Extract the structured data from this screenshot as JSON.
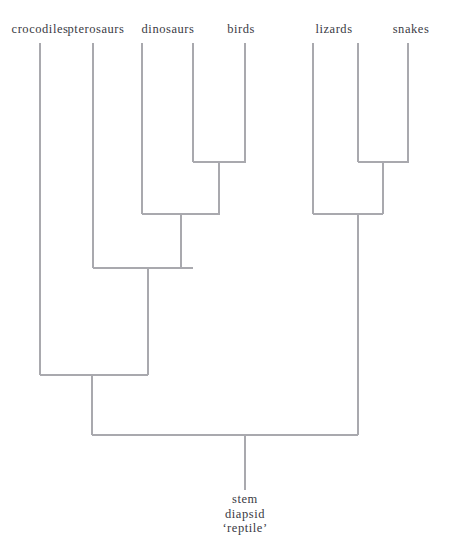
{
  "figure": {
    "type": "cladogram",
    "background_color": "#ffffff",
    "line_color": "#a9a9ae",
    "text_color": "#3a3a44",
    "width": 449,
    "height": 541
  },
  "tips": [
    {
      "label": "crocodiles",
      "x": 40,
      "label_x": 40,
      "label_y": 22
    },
    {
      "label": "pterosaurs",
      "x": 93,
      "label_x": 96,
      "label_y": 22
    },
    {
      "label": "dinosaurs",
      "x": 142,
      "label_x": 168,
      "label_y": 22
    },
    {
      "label": "birds",
      "x": 245,
      "label_x": 241,
      "label_y": 22
    },
    {
      "label": "lizards",
      "x": 313,
      "label_x": 334,
      "label_y": 22
    },
    {
      "label": "snakes",
      "x": 408,
      "label_x": 411,
      "label_y": 22
    }
  ],
  "extra_tip_lines": [
    {
      "x": 193
    },
    {
      "x": 358
    }
  ],
  "root": {
    "lines": [
      "stem",
      "diapsid",
      "‘reptile’"
    ],
    "label_x": 245,
    "label_y": 492,
    "stem_x": 245,
    "stem_top": 435,
    "stem_bottom": 490
  },
  "nodes": [
    {
      "name": "birds-node",
      "bar_y": 162,
      "x_left": 193,
      "x_right": 246,
      "stem_x": 219,
      "stem_to": 214
    },
    {
      "name": "lizards-snakes-node",
      "bar_y": 162,
      "x_left": 358,
      "x_right": 409,
      "stem_x": 383,
      "stem_to": 214
    },
    {
      "name": "dinosaur-bird-node",
      "bar_y": 214,
      "x_left": 142,
      "x_right": 220,
      "stem_x": 181,
      "stem_to": 268
    },
    {
      "name": "squamate-node",
      "bar_y": 214,
      "x_left": 313,
      "x_right": 383,
      "stem_x": 358,
      "stem_to": 435
    },
    {
      "name": "ornithodira-node",
      "bar_y": 268,
      "x_left": 93,
      "x_right": 193,
      "stem_x": 148,
      "stem_to": 375
    },
    {
      "name": "archosaur-node",
      "bar_y": 375,
      "x_left": 40,
      "x_right": 148,
      "stem_x": 92,
      "stem_to": 435
    },
    {
      "name": "root-node",
      "bar_y": 435,
      "x_left": 92,
      "x_right": 358,
      "stem_x": 245,
      "stem_to": 490
    }
  ],
  "tip_stems": [
    {
      "name": "crocodiles-stem",
      "x": 40,
      "y_top": 43,
      "y_bottom": 375
    },
    {
      "name": "pterosaurs-stem",
      "x": 93,
      "y_top": 43,
      "y_bottom": 268
    },
    {
      "name": "dinosaurs-stem",
      "x": 142,
      "y_top": 43,
      "y_bottom": 214
    },
    {
      "name": "dinosaur-inner-stem",
      "x": 193,
      "y_top": 43,
      "y_bottom": 162
    },
    {
      "name": "birds-stem",
      "x": 245,
      "y_top": 43,
      "y_bottom": 162
    },
    {
      "name": "lizards-stem",
      "x": 313,
      "y_top": 43,
      "y_bottom": 214
    },
    {
      "name": "lizards-inner-stem",
      "x": 358,
      "y_top": 43,
      "y_bottom": 162
    },
    {
      "name": "snakes-stem",
      "x": 408,
      "y_top": 43,
      "y_bottom": 162
    }
  ]
}
